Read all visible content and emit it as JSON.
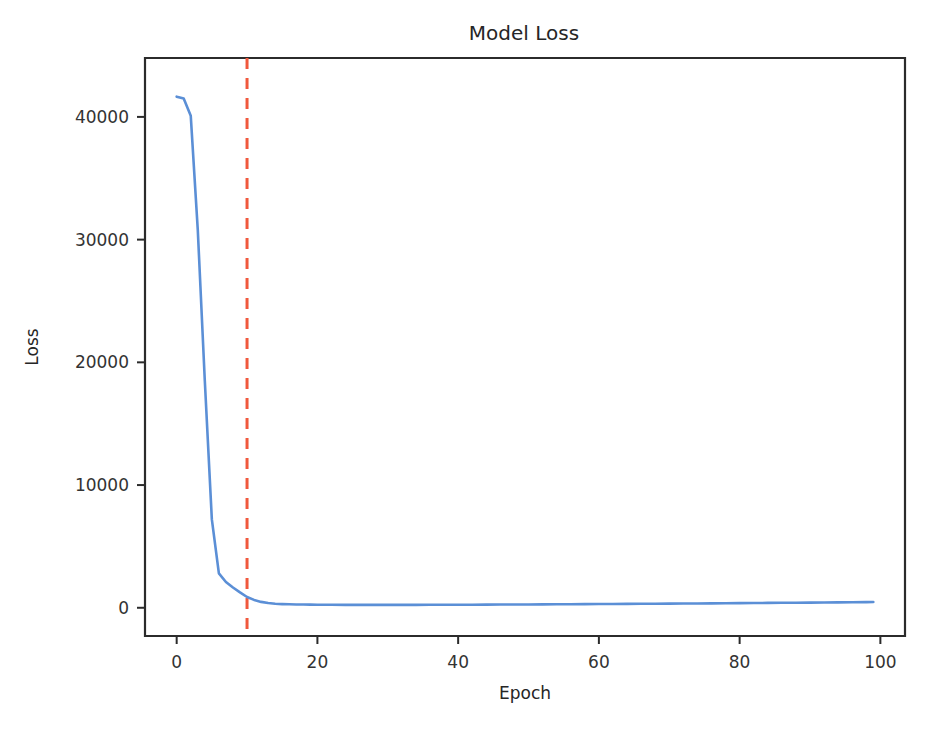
{
  "chart_data": {
    "type": "line",
    "title": "Model Loss",
    "xlabel": "Epoch",
    "ylabel": "Loss",
    "xlim": [
      -4.5,
      103.5
    ],
    "ylim": [
      -2300,
      44800
    ],
    "grid": false,
    "legend": null,
    "xticks": [
      0,
      20,
      40,
      60,
      80,
      100
    ],
    "xticklabels": [
      "0",
      "20",
      "40",
      "60",
      "80",
      "100"
    ],
    "yticks": [
      0,
      10000,
      20000,
      30000,
      40000
    ],
    "yticklabels": [
      "0",
      "10000",
      "20000",
      "30000",
      "40000"
    ],
    "series": [
      {
        "name": "loss",
        "color": "#5B8FD6",
        "style": "solid",
        "x": [
          0,
          1,
          2,
          3,
          4,
          5,
          6,
          7,
          8,
          9,
          10,
          11,
          12,
          13,
          14,
          15,
          16,
          17,
          18,
          19,
          20,
          22,
          24,
          26,
          28,
          30,
          32,
          34,
          36,
          38,
          40,
          42,
          44,
          46,
          48,
          50,
          52,
          54,
          56,
          58,
          60,
          62,
          64,
          66,
          68,
          70,
          72,
          74,
          76,
          78,
          80,
          82,
          84,
          86,
          88,
          90,
          92,
          94,
          96,
          98,
          99
        ],
        "y": [
          41650,
          41500,
          40100,
          30800,
          18500,
          7200,
          2800,
          2100,
          1650,
          1250,
          880,
          640,
          480,
          390,
          330,
          300,
          282,
          270,
          262,
          256,
          250,
          243,
          238,
          235,
          234,
          234,
          236,
          238,
          241,
          244,
          248,
          252,
          257,
          262,
          267,
          272,
          278,
          284,
          290,
          296,
          303,
          310,
          317,
          324,
          331,
          338,
          346,
          354,
          362,
          370,
          378,
          387,
          396,
          405,
          414,
          423,
          433,
          443,
          453,
          463,
          468
        ]
      }
    ],
    "annotations": [
      {
        "name": "best-epoch-marker",
        "type": "vline",
        "x": 10,
        "color": "#F0583D",
        "style": "dashed",
        "label": ""
      }
    ]
  },
  "figure": {
    "background": "#ffffff",
    "axes_color": "#2b2b2b"
  }
}
